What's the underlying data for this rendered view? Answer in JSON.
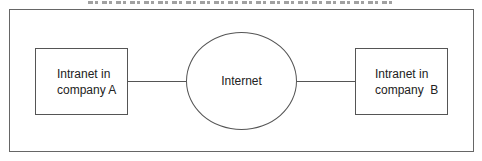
{
  "diagram": {
    "type": "network",
    "title": {
      "visible": "clipped",
      "note": "caption cut off at top edge; text not legible"
    },
    "nodes": [
      {
        "id": "a",
        "shape": "rectangle",
        "lines": [
          "Intranet in",
          "company A"
        ]
      },
      {
        "id": "internet",
        "shape": "ellipse",
        "lines": [
          "Internet"
        ]
      },
      {
        "id": "b",
        "shape": "rectangle",
        "lines": [
          "Intranet in",
          "company  B"
        ]
      }
    ],
    "edges": [
      {
        "from": "a",
        "to": "internet"
      },
      {
        "from": "internet",
        "to": "b"
      }
    ]
  }
}
